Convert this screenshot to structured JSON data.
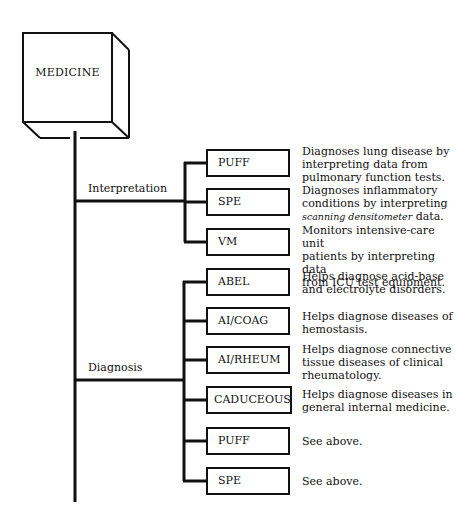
{
  "root": {
    "label": "MEDICINE"
  },
  "branches": [
    {
      "label": "Interpretation",
      "systems": [
        {
          "name": "PUFF",
          "description": "Diagnoses lung disease by\ninterpreting data from\npulmonary function tests."
        },
        {
          "name": "SPE",
          "description_pre": "Diagnoses inflammatory\nconditions by interpreting\n",
          "description_italic": "scanning densitometer",
          "description_post": "  data."
        },
        {
          "name": "VM",
          "description": "Monitors intensive-care unit\npatients by interpreting data\nfrom ICU test equipment."
        }
      ]
    },
    {
      "label": "Diagnosis",
      "systems": [
        {
          "name": "ABEL",
          "description": "Helps diagnose acid-base\nand electrolyte disorders."
        },
        {
          "name": "AI/COAG",
          "description": "Helps diagnose diseases of\nhemostasis."
        },
        {
          "name": "AI/RHEUM",
          "description": "Helps diagnose connective\ntissue diseases of clinical\nrheumatology."
        },
        {
          "name": "CADUCEOUS",
          "description": "Helps diagnose diseases in\ngeneral internal medicine."
        },
        {
          "name": "PUFF",
          "description": "See above."
        },
        {
          "name": "SPE",
          "description": "See above."
        }
      ]
    }
  ]
}
